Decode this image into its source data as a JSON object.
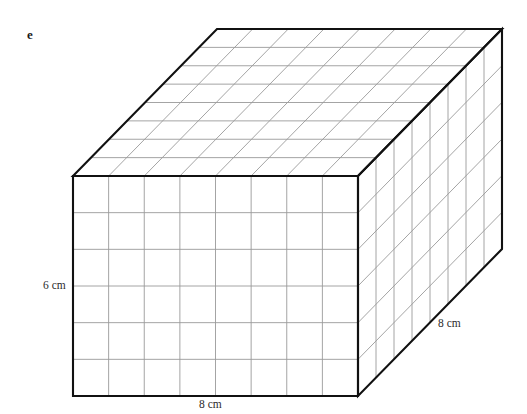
{
  "figure": {
    "part_label": "e",
    "shape_name": "rectangular-prism",
    "labels": {
      "width": "8 cm",
      "height": "6 cm",
      "depth": "8 cm"
    },
    "colors": {
      "outline": "#111111",
      "grid": "#9a9a9a",
      "background": "#ffffff",
      "text": "#1a1a1a"
    }
  },
  "chart_data": {
    "type": "diagram",
    "title": "e",
    "subtitle": "",
    "shape": "rectangular prism (cuboid)",
    "projection": "oblique",
    "dimensions": {
      "width_cm": 8,
      "height_cm": 6,
      "depth_cm": 8
    },
    "grid": {
      "front_face_columns": 8,
      "front_face_rows": 6,
      "top_face_columns": 8,
      "top_face_rows": 8,
      "right_face_columns": 8,
      "right_face_rows": 6,
      "unit_cm": 1
    },
    "annotations": [
      {
        "text": "8 cm",
        "edge": "front-bottom",
        "position": "below"
      },
      {
        "text": "6 cm",
        "edge": "front-left",
        "position": "left"
      },
      {
        "text": "8 cm",
        "edge": "right-bottom",
        "position": "right"
      }
    ],
    "geometry_px": {
      "front_top_left": [
        73,
        176
      ],
      "front_top_right": [
        358,
        176
      ],
      "front_bottom_left": [
        73,
        396
      ],
      "front_bottom_right": [
        358,
        396
      ],
      "depth_offset": [
        144,
        -147
      ]
    }
  }
}
